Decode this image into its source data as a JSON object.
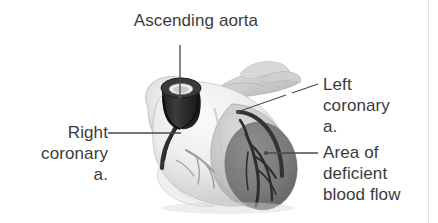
{
  "figure": {
    "background_color": "#ffffff",
    "text_color": "#3b3b3b",
    "width": 438,
    "height": 223
  },
  "labels": {
    "ascending_aorta": "Ascending aorta",
    "right_coronary": "Right\ncoronary\na.",
    "left_coronary": "Left\ncoronary\na.",
    "area_deficient": "Area of\ndeficient\nblood flow"
  },
  "illustration": {
    "subject": "human-heart-anterior-view",
    "style": "grayscale-halftone-photograph",
    "parts": [
      {
        "name": "ascending-aorta-stump",
        "description": "dark cut cylindrical aorta stump with visible lumen ring at top of heart",
        "color": "#2b2b2b"
      },
      {
        "name": "pulmonary-trunk-and-great-vessels",
        "description": "light gray vessels extending to the upper right",
        "color": "#c9c9c9"
      },
      {
        "name": "right-atrium",
        "description": "pale bulging chamber on the left of the image",
        "color": "#dedede"
      },
      {
        "name": "right-ventricle",
        "description": "large pale anterior chamber forming the body of the heart",
        "color": "#e6e6e6"
      },
      {
        "name": "left-ventricle",
        "description": "rounded chamber on the right side of the image",
        "color": "#b9b9b9"
      },
      {
        "name": "right-coronary-artery",
        "description": "dark artery descending from aorta along the atrioventricular groove",
        "color": "#3a3a3a"
      },
      {
        "name": "left-coronary-artery",
        "description": "dark artery branching from aorta to the right over the left ventricle",
        "color": "#3a3a3a"
      },
      {
        "name": "ischemic-region",
        "description": "dark gray oval patch of deficient blood flow on the left ventricle",
        "color": "#7d7d7d"
      },
      {
        "name": "cardiac-apex",
        "description": "pointed lower tip of the heart",
        "color": "#ededed"
      }
    ],
    "leader_lines": [
      {
        "name": "leader-ascending-aorta",
        "from": [
          180,
          45
        ],
        "to": [
          180,
          98
        ],
        "endpoint": "dot"
      },
      {
        "name": "leader-right-coronary",
        "from": [
          108,
          133
        ],
        "to": [
          181,
          133
        ],
        "endpoint": "plain"
      },
      {
        "name": "leader-left-coronary",
        "from": [
          318,
          85
        ],
        "to": [
          239,
          112
        ],
        "endpoint": "dot"
      },
      {
        "name": "leader-area-deficient",
        "from": [
          318,
          153
        ],
        "to": [
          266,
          153
        ],
        "endpoint": "dot"
      }
    ]
  }
}
